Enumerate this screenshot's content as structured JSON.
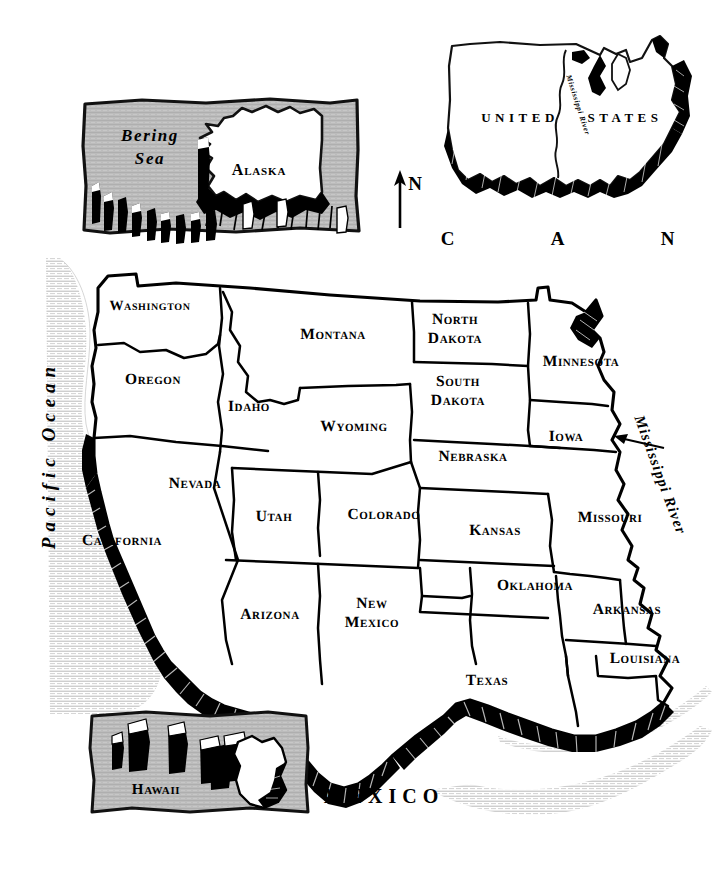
{
  "figure": {
    "kind": "hand-drawn pen-and-ink map",
    "background_color": "#ffffff",
    "ink_color": "#000000",
    "sea_tone": "#b9b9b9",
    "shadow_tone": "#c9c9c9"
  },
  "water": {
    "pacific": "Pacific Ocean",
    "bering": "Bering\nSea",
    "mississippi_main": "Mississippi River",
    "mississippi_inset": "Mississippi River"
  },
  "compass": {
    "north_label": "N"
  },
  "insets": {
    "alaska": {
      "label": "Alaska"
    },
    "hawaii": {
      "label": "Hawaii"
    },
    "locator": {
      "word_left": "UNITED",
      "word_right": "STATES",
      "neighbor_letters": [
        "C",
        "A",
        "N"
      ]
    }
  },
  "neighbors": {
    "mexico": "MEXICO"
  },
  "states": [
    {
      "name": "Washington",
      "label": "Washington",
      "x": 150,
      "y": 307,
      "size": "sm",
      "lines": 1
    },
    {
      "name": "Oregon",
      "label": "Oregon",
      "x": 153,
      "y": 380,
      "size": "",
      "lines": 1
    },
    {
      "name": "California",
      "label": "California",
      "x": 122,
      "y": 541,
      "size": "",
      "lines": 1
    },
    {
      "name": "Nevada",
      "label": "Nevada",
      "x": 195,
      "y": 484,
      "size": "",
      "lines": 1
    },
    {
      "name": "Idaho",
      "label": "Idaho",
      "x": 249,
      "y": 407,
      "size": "",
      "lines": 1
    },
    {
      "name": "Montana",
      "label": "Montana",
      "x": 333,
      "y": 335,
      "size": "",
      "lines": 1
    },
    {
      "name": "Wyoming",
      "label": "Wyoming",
      "x": 354,
      "y": 427,
      "size": "",
      "lines": 1
    },
    {
      "name": "Utah",
      "label": "Utah",
      "x": 274,
      "y": 517,
      "size": "",
      "lines": 1
    },
    {
      "name": "Colorado",
      "label": "Colorado",
      "x": 384,
      "y": 515,
      "size": "",
      "lines": 1
    },
    {
      "name": "Arizona",
      "label": "Arizona",
      "x": 270,
      "y": 615,
      "size": "",
      "lines": 1
    },
    {
      "name": "New Mexico",
      "label": "New\nMexico",
      "x": 372,
      "y": 614,
      "size": "",
      "lines": 2
    },
    {
      "name": "North Dakota",
      "label": "North\nDakota",
      "x": 455,
      "y": 330,
      "size": "",
      "lines": 2
    },
    {
      "name": "South Dakota",
      "label": "South\nDakota",
      "x": 458,
      "y": 392,
      "size": "",
      "lines": 2
    },
    {
      "name": "Nebraska",
      "label": "Nebraska",
      "x": 473,
      "y": 457,
      "size": "",
      "lines": 1
    },
    {
      "name": "Kansas",
      "label": "Kansas",
      "x": 495,
      "y": 531,
      "size": "",
      "lines": 1
    },
    {
      "name": "Oklahoma",
      "label": "Oklahoma",
      "x": 535,
      "y": 586,
      "size": "",
      "lines": 1
    },
    {
      "name": "Texas",
      "label": "Texas",
      "x": 487,
      "y": 681,
      "size": "",
      "lines": 1
    },
    {
      "name": "Minnesota",
      "label": "Minnesota",
      "x": 581,
      "y": 362,
      "size": "",
      "lines": 1
    },
    {
      "name": "Iowa",
      "label": "Iowa",
      "x": 566,
      "y": 437,
      "size": "",
      "lines": 1
    },
    {
      "name": "Missouri",
      "label": "Missouri",
      "x": 610,
      "y": 518,
      "size": "",
      "lines": 1
    },
    {
      "name": "Arkansas",
      "label": "Arkansas",
      "x": 627,
      "y": 610,
      "size": "",
      "lines": 1
    },
    {
      "name": "Louisiana",
      "label": "Louisiana",
      "x": 645,
      "y": 659,
      "size": "",
      "lines": 1
    }
  ]
}
